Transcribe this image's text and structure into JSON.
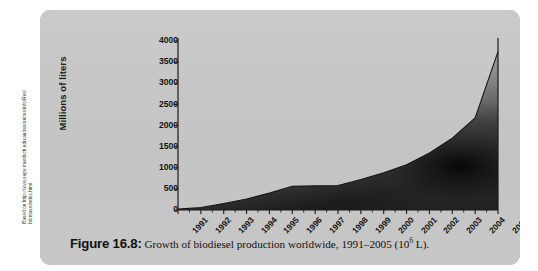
{
  "source_credit": "Based on http://www.sepe.murdoch.edu.au/resources/info/Res/\nbiomass/index.html",
  "caption": {
    "figure_number": "Figure 16.8:",
    "text_before": "Growth of biodiesel production worldwide, 1991–2005 (10",
    "exponent": "6",
    "text_after": " L)."
  },
  "colors": {
    "panel_bg": "#c6c6c6",
    "axis": "#1a1a1a",
    "area_top": "#b4b4b4",
    "area_dark": "#1c1c1c",
    "text": "#141414"
  },
  "chart_data": {
    "type": "area",
    "title": "",
    "xlabel": "",
    "ylabel": "Millions of liters",
    "x": [
      "1991",
      "1992",
      "1993",
      "1994",
      "1995",
      "1996",
      "1997",
      "1998",
      "1999",
      "2000",
      "2001",
      "2002",
      "2003",
      "2004",
      "2005"
    ],
    "values": [
      20,
      60,
      150,
      260,
      400,
      560,
      570,
      580,
      720,
      880,
      1070,
      1350,
      1700,
      2180,
      3750
    ],
    "ylim": [
      0,
      4000
    ],
    "yticks": [
      0,
      500,
      1000,
      1500,
      2000,
      2500,
      3000,
      3500,
      4000
    ],
    "ytick_labels": [
      "0",
      "500",
      "1000",
      "1500",
      "2000",
      "2500",
      "3000",
      "3500",
      "4000"
    ],
    "xtick_labels": [
      "1991",
      "1992",
      "1993",
      "1994",
      "1995",
      "1996",
      "1997",
      "1998",
      "1999",
      "2000",
      "2001",
      "2002",
      "2003",
      "2004",
      "2005"
    ],
    "grid": false,
    "legend": null,
    "units": "10^6 L"
  }
}
